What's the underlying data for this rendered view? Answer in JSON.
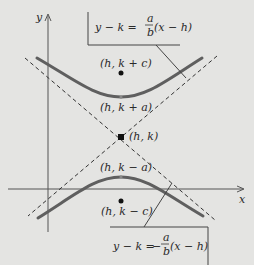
{
  "diagram": {
    "axes": {
      "x_label": "x",
      "y_label": "y"
    },
    "points": [
      {
        "id": "focus-top",
        "label": "(h, k + c)"
      },
      {
        "id": "vertex-top",
        "label": "(h, k + a)"
      },
      {
        "id": "center",
        "label": "(h, k)"
      },
      {
        "id": "vertex-bottom",
        "label": "(h, k − a)"
      },
      {
        "id": "focus-bottom",
        "label": "(h, k − c)"
      }
    ],
    "asymptotes": [
      {
        "id": "positive",
        "lhs": "y − k =",
        "coef_num": "a",
        "coef_den": "b",
        "sign": "",
        "rhs": "(x − h)"
      },
      {
        "id": "negative",
        "lhs": "y − k =",
        "coef_num": "a",
        "coef_den": "b",
        "sign": "−",
        "rhs": "(x − h)"
      }
    ],
    "colors": {
      "background": "#e4e4e2",
      "curve": "#5a5a5a",
      "axis": "#444444",
      "dash": "#333333"
    }
  }
}
